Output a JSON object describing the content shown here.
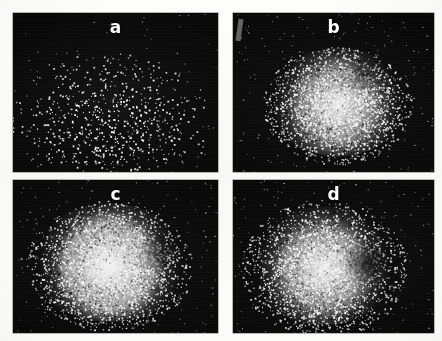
{
  "figure": {
    "background_color": "#fbfbf9",
    "panel_background_color": "#0d0d0d",
    "point_color": "#f2f2f2",
    "label_color": "#fdfdfd",
    "layout": {
      "rows": 2,
      "columns": 2
    }
  },
  "chart_data": {
    "type": "scatter",
    "title": "",
    "xlabel": "",
    "ylabel": "",
    "grid": false,
    "legend": null,
    "panels": [
      {
        "label": "a",
        "label_position": "top-center",
        "rect": {
          "x": 13,
          "y": 13,
          "width": 205,
          "height": 159
        },
        "point_count": 900,
        "description": "sparse diffuse cloud, density concentrated low-center",
        "center_x": 0.47,
        "center_y": 0.68,
        "spread_x": 0.26,
        "spread_y": 0.24,
        "core_fill": 0.12,
        "core_radius": 0.13,
        "halo_extent": 1.9
      },
      {
        "label": "b",
        "label_position": "top-center",
        "rect": {
          "x": 233,
          "y": 13,
          "width": 201,
          "height": 159
        },
        "point_count": 2600,
        "description": "dense saturated round core with speckled halo",
        "center_x": 0.52,
        "center_y": 0.58,
        "spread_x": 0.22,
        "spread_y": 0.22,
        "core_fill": 0.62,
        "core_radius": 0.27,
        "halo_extent": 1.7
      },
      {
        "label": "c",
        "label_position": "top-center",
        "rect": {
          "x": 13,
          "y": 180,
          "width": 205,
          "height": 153
        },
        "point_count": 2900,
        "description": "large bright core filling most of panel, broad halo",
        "center_x": 0.47,
        "center_y": 0.56,
        "spread_x": 0.24,
        "spread_y": 0.25,
        "core_fill": 0.7,
        "core_radius": 0.3,
        "halo_extent": 1.7
      },
      {
        "label": "d",
        "label_position": "top-center",
        "rect": {
          "x": 233,
          "y": 180,
          "width": 201,
          "height": 153
        },
        "point_count": 2800,
        "description": "bright core with darker notch on right side, speckled halo",
        "center_x": 0.45,
        "center_y": 0.58,
        "spread_x": 0.23,
        "spread_y": 0.25,
        "core_fill": 0.63,
        "core_radius": 0.28,
        "halo_extent": 1.8
      }
    ]
  },
  "labels": {
    "panel_a": "a",
    "panel_b": "b",
    "panel_c": "c",
    "panel_d": "d"
  }
}
